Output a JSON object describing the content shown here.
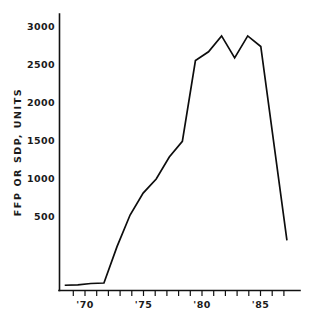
{
  "chart_data": {
    "type": "line",
    "title": "",
    "xlabel": "",
    "ylabel": "FFP OR SDP, UNITS",
    "x": [
      1969,
      1970,
      1971,
      1972,
      1973,
      1974,
      1975,
      1976,
      1977,
      1978,
      1979,
      1980,
      1981,
      1982,
      1983,
      1984,
      1986
    ],
    "values": [
      60,
      65,
      80,
      85,
      500,
      860,
      1110,
      1270,
      1520,
      1700,
      2620,
      2720,
      2900,
      2650,
      2900,
      2780,
      570
    ],
    "series": [
      {
        "name": "FFP or SDP units",
        "values": [
          60,
          65,
          80,
          85,
          500,
          860,
          1110,
          1270,
          1520,
          1700,
          2620,
          2720,
          2900,
          2650,
          2900,
          2780,
          570
        ]
      }
    ],
    "xlim": [
      1968.6,
      1987.0
    ],
    "ylim": [
      0,
      3150
    ],
    "y_ticks": [
      500,
      1000,
      1500,
      2000,
      2500,
      3000
    ],
    "y_tick_labels": [
      "500",
      "1000",
      "1500",
      "2000",
      "2500",
      "3000"
    ],
    "x_ticks": [
      1969,
      1970,
      1971,
      1972,
      1973,
      1974,
      1975,
      1976,
      1977,
      1978,
      1979,
      1980,
      1981,
      1982,
      1983,
      1984,
      1985,
      1986
    ],
    "x_tick_labels": [
      "",
      "'70",
      "",
      "",
      "",
      "",
      "'75",
      "",
      "",
      "",
      "",
      "'80",
      "",
      "",
      "",
      "",
      "'85",
      ""
    ],
    "x_labeled_ticks": [
      {
        "value": 1970,
        "label": "'70"
      },
      {
        "value": 1975,
        "label": "'75"
      },
      {
        "value": 1980,
        "label": "'80"
      },
      {
        "value": 1985,
        "label": "'85"
      }
    ],
    "grid": false,
    "legend": false,
    "legend_position": "none",
    "line_color": "#0d0d0d",
    "axis_color": "#111111",
    "background_color": "#ffffff"
  }
}
